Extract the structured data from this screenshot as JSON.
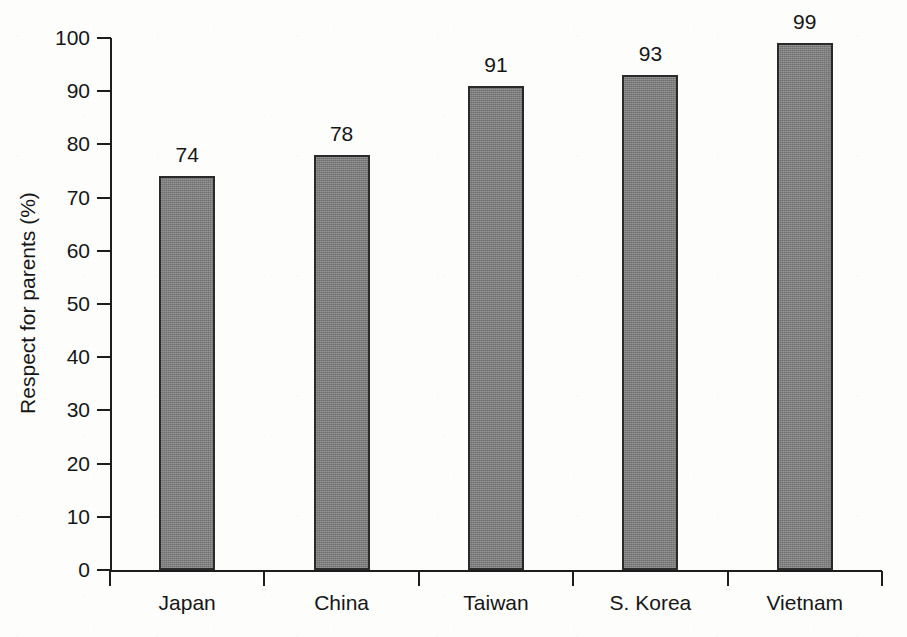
{
  "chart_data": {
    "type": "bar",
    "title": "",
    "subtitle": "",
    "xlabel": "",
    "ylabel": "Respect for parents (%)",
    "categories": [
      "Japan",
      "China",
      "Taiwan",
      "S. Korea",
      "Vietnam"
    ],
    "values": [
      74,
      78,
      91,
      93,
      99
    ],
    "value_labels": [
      "74",
      "78",
      "91",
      "93",
      "99"
    ],
    "ylim": [
      0,
      100
    ],
    "ytick_step": 10,
    "ytick_labels": [
      "0",
      "10",
      "20",
      "30",
      "40",
      "50",
      "60",
      "70",
      "80",
      "90",
      "100"
    ],
    "ytick_values": [
      0,
      10,
      20,
      30,
      40,
      50,
      60,
      70,
      80,
      90,
      100
    ],
    "grid": false,
    "legend": false,
    "legend_position": "none",
    "bar_color": "#7e7e7e",
    "bar_border_color": "#2a2a2a",
    "axis_color": "#1d1d1d",
    "background_color": "#fdfdfc",
    "tick_direction": "outward",
    "series": [
      {
        "name": "Respect for parents",
        "values": [
          74,
          78,
          91,
          93,
          99
        ]
      }
    ]
  }
}
